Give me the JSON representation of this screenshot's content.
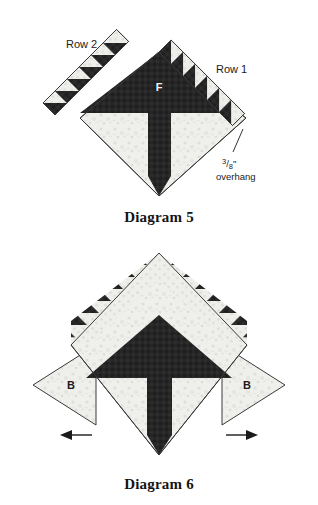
{
  "page": {
    "background_color": "#ffffff",
    "width": 318,
    "height": 505
  },
  "colors": {
    "dark_fabric": "#262626",
    "light_print": "#efefec",
    "outline": "#3a3a3a",
    "text": "#1b1b1b",
    "caption": "#141414"
  },
  "figures": [
    {
      "id": "diagram-5",
      "caption": "Diagram 5",
      "labels": {
        "row1": "Row 1",
        "row2": "Row 2",
        "center_piece": "F",
        "overhang_numerator": "3",
        "overhang_denominator": "8",
        "overhang_unit": "\"",
        "overhang_word": "overhang"
      },
      "pieces": {
        "row1_units": 6,
        "row2_units": 6,
        "row2_attached": false,
        "row1_attached": true
      }
    },
    {
      "id": "diagram-6",
      "caption": "Diagram 6",
      "labels": {
        "left_triangle": "B",
        "right_triangle": "B"
      },
      "pieces": {
        "triangle_rows": 4,
        "left_arrow_direction": "left",
        "right_arrow_direction": "right"
      }
    }
  ]
}
